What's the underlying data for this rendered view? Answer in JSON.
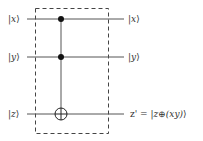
{
  "diagram": {
    "type": "quantum-circuit",
    "gate": "Toffoli (CCNOT)",
    "inputs": [
      {
        "open": "|",
        "var": "x",
        "close": "⟩"
      },
      {
        "open": "|",
        "var": "y",
        "close": "⟩"
      },
      {
        "open": "|",
        "var": "z",
        "close": "⟩"
      }
    ],
    "outputs": [
      {
        "open": "|",
        "var": "x",
        "close": "⟩"
      },
      {
        "open": "|",
        "var": "y",
        "close": "⟩"
      },
      {
        "prefix": "z' = |",
        "var": "z",
        "op": "⊕",
        "expr": "(xy)",
        "close": "⟩"
      }
    ],
    "controls": [
      "x",
      "y"
    ],
    "target": "z",
    "colors": {
      "wire": "#555555",
      "box": "#444444",
      "dot": "#111111",
      "text": "#333333"
    }
  }
}
